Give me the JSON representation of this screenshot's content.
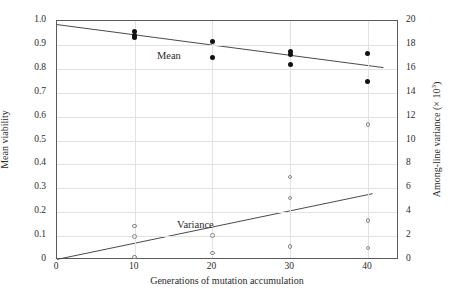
{
  "chart_data": {
    "type": "scatter",
    "title": "",
    "xlabel": "Generations of mutation accumulation",
    "ylabel_left": "Mean viability",
    "ylabel_right": "Among-line variance (× 10³)",
    "ylabel_right_base": "Among-line variance (× 10",
    "ylabel_right_exp": "3",
    "ylabel_right_tail": ")",
    "xlim": [
      0,
      44
    ],
    "ylim_left": [
      0,
      1.0
    ],
    "ylim_right": [
      0,
      20
    ],
    "grid": true,
    "legend_position": "inline-annotations",
    "xticks": [
      0,
      10,
      20,
      30,
      40
    ],
    "xtick_labels": [
      "0",
      "10",
      "20",
      "30",
      "40"
    ],
    "yticks_left": [
      0,
      0.1,
      0.2,
      0.3,
      0.4,
      0.5,
      0.6,
      0.7,
      0.8,
      0.9,
      1.0
    ],
    "ytick_labels_left": [
      "0",
      "0.1",
      "0.2",
      "0.3",
      "0.4",
      "0.5",
      "0.6",
      "0.7",
      "0.8",
      "0.9",
      "1.0"
    ],
    "yticks_right": [
      0,
      2,
      4,
      6,
      8,
      10,
      12,
      14,
      16,
      18,
      20
    ],
    "ytick_labels_right": [
      "0",
      "2",
      "4",
      "6",
      "8",
      "10",
      "12",
      "14",
      "16",
      "18",
      "20"
    ],
    "annotations": [
      {
        "text": "Mean",
        "x": 14.4,
        "y_left": 0.855,
        "axis": "left"
      },
      {
        "text": "Variance",
        "x": 17.8,
        "y_left": 0.145,
        "axis": "left"
      }
    ],
    "series": [
      {
        "name": "Mean",
        "marker": "filled-circle",
        "color": "#111111",
        "axis": "left",
        "points": [
          {
            "x": 10,
            "y": 0.955
          },
          {
            "x": 10,
            "y": 0.94
          },
          {
            "x": 10,
            "y": 0.93
          },
          {
            "x": 20,
            "y": 0.915
          },
          {
            "x": 20,
            "y": 0.848
          },
          {
            "x": 30,
            "y": 0.872
          },
          {
            "x": 30,
            "y": 0.858
          },
          {
            "x": 30,
            "y": 0.82
          },
          {
            "x": 40,
            "y": 0.862
          },
          {
            "x": 40,
            "y": 0.745
          }
        ]
      },
      {
        "name": "Variance",
        "marker": "open-circle",
        "color": "#8a8a8a",
        "axis": "right",
        "points": [
          {
            "x": 10,
            "y": 2.85
          },
          {
            "x": 10,
            "y": 1.95
          },
          {
            "x": 10,
            "y": 0.25
          },
          {
            "x": 20,
            "y": 2.05
          },
          {
            "x": 20,
            "y": 0.6
          },
          {
            "x": 30,
            "y": 6.95
          },
          {
            "x": 30,
            "y": 5.2
          },
          {
            "x": 30,
            "y": 1.15
          },
          {
            "x": 40,
            "y": 11.35
          },
          {
            "x": 40,
            "y": 3.3
          },
          {
            "x": 40,
            "y": 1.0
          }
        ]
      }
    ],
    "trendlines": [
      {
        "name": "Mean regression",
        "axis": "left",
        "x0": 0,
        "y0": 0.985,
        "x1": 42.0,
        "y1": 0.805,
        "color": "#4a4a4a"
      },
      {
        "name": "Variance regression",
        "axis": "right",
        "x0": 0,
        "y0": 0.05,
        "x1": 40.6,
        "y1": 5.55,
        "color": "#4a4a4a"
      }
    ]
  }
}
